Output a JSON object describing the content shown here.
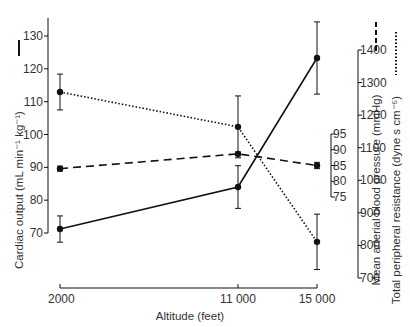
{
  "chart_data": {
    "type": "line",
    "title": "",
    "xlabel": "Altitude (feet)",
    "x": [
      2000,
      11000,
      15000
    ],
    "x_tick_labels": [
      "2000",
      "11 000",
      "15 000"
    ],
    "axes": [
      {
        "id": "co",
        "label": "Cardiac output (mL min⁻¹ kg⁻¹)",
        "position": "left",
        "range": [
          70,
          135
        ],
        "ticks": [
          70,
          80,
          90,
          100,
          110,
          120,
          130
        ]
      },
      {
        "id": "map",
        "label": "Mean arterial blood pressure (mmHg)",
        "position": "right-inner",
        "range": [
          75,
          95
        ],
        "ticks": [
          75,
          80,
          85,
          90,
          95
        ]
      },
      {
        "id": "tpr",
        "label": "Total peripheral resistance (dyne s cm⁻⁵)",
        "position": "right-outer",
        "range": [
          700,
          1400
        ],
        "ticks": [
          700,
          800,
          900,
          1000,
          1100,
          1200,
          1300,
          1400
        ]
      }
    ],
    "series": [
      {
        "name": "Cardiac output",
        "axis": "co",
        "line_style": "solid",
        "values": [
          71.2,
          84.0,
          123.3
        ],
        "error": [
          4.0,
          6.5,
          11.0
        ]
      },
      {
        "name": "Mean arterial blood pressure",
        "axis": "map",
        "line_style": "dashed",
        "values": [
          84.0,
          88.7,
          85.0
        ],
        "error": [
          0.8,
          0.6,
          1.0
        ]
      },
      {
        "name": "Total peripheral resistance",
        "axis": "tpr",
        "line_style": "dotted",
        "values": [
          1271,
          1164,
          811
        ],
        "error": [
          55,
          95,
          85
        ]
      }
    ],
    "grid": false,
    "legend": "inline in axis titles (line-style swatches)"
  }
}
